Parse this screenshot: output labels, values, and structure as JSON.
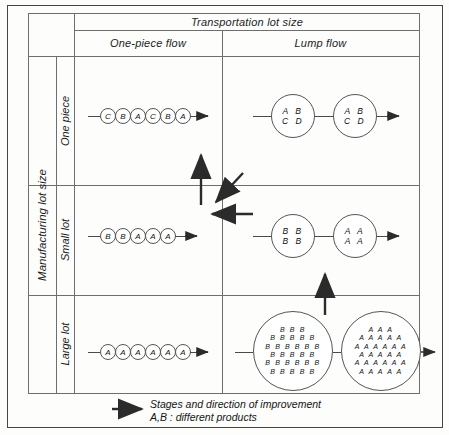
{
  "figure": {
    "column_axis_title": "Transportation lot size",
    "row_axis_title": "Manufacturing lot size",
    "columns": [
      {
        "label": "One-piece flow"
      },
      {
        "label": "Lump flow"
      }
    ],
    "rows": [
      {
        "label": "One piece"
      },
      {
        "label": "Small lot"
      },
      {
        "label": "Large lot"
      }
    ]
  },
  "cells": {
    "one_piece_one_piece_flow": {
      "type": "chain",
      "nodes": [
        "C",
        "B",
        "A",
        "C",
        "B",
        "A"
      ]
    },
    "one_piece_lump_flow": {
      "type": "batches",
      "batches": [
        {
          "lines": [
            "A  B",
            "C  D"
          ]
        },
        {
          "lines": [
            "A  B",
            "C  D"
          ]
        }
      ]
    },
    "small_lot_one_piece_flow": {
      "type": "chain",
      "nodes": [
        "B",
        "B",
        "A",
        "A",
        "A"
      ]
    },
    "small_lot_lump_flow": {
      "type": "batches",
      "batches": [
        {
          "lines": [
            "B  B",
            "B  B"
          ]
        },
        {
          "lines": [
            "A  A",
            "A  A"
          ]
        }
      ]
    },
    "large_lot_one_piece_flow": {
      "type": "chain",
      "nodes": [
        "A",
        "A",
        "A",
        "A",
        "A",
        "A"
      ]
    },
    "large_lot_lump_flow": {
      "type": "batches",
      "batches": [
        {
          "lines": [
            "B B B",
            "B B B B B",
            "B B B B B B",
            "B B B B B",
            "B B B B B B",
            "B B B B B"
          ]
        },
        {
          "lines": [
            "A A A",
            "A A A A A",
            "A A A A A A",
            "A A A A A",
            "A A A A A A",
            "A A A A A"
          ]
        }
      ]
    }
  },
  "improvement_arrows": [
    {
      "name": "arrow-up-from-small-lot-one-piece-flow",
      "direction": "up"
    },
    {
      "name": "arrow-diagonal-from-lump-flow-to-one-piece-flow",
      "direction": "down-left"
    },
    {
      "name": "arrow-left-from-lump-flow-to-one-piece-flow",
      "direction": "left"
    },
    {
      "name": "arrow-up-from-large-lot-lump-flow",
      "direction": "up"
    }
  ],
  "legend": {
    "arrow_icon": "right-arrow-icon",
    "line1": "Stages and direction of improvement",
    "line2": "A,B : different products"
  },
  "colors": {
    "line": "#6e6e6e",
    "ink": "#1a1a1a",
    "background": "#fdfdfc",
    "border": "#444444"
  }
}
